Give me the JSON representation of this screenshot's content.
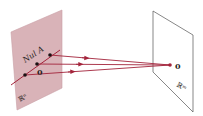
{
  "diagram": {
    "type": "linear-transformation-kernel",
    "domain_space": {
      "label": "ℝⁿ",
      "color": "#d9b3b8"
    },
    "codomain_space": {
      "label": "ℝᵐ",
      "color": "#ffffff"
    },
    "null_space_label": "Nul A",
    "domain_zero_label": "0",
    "codomain_zero_label": "0",
    "arrow_color": "#a3243b",
    "arrows": [
      {
        "from": "point-on-Nul-A-1",
        "to": "codomain-zero"
      },
      {
        "from": "domain-zero",
        "to": "codomain-zero"
      },
      {
        "from": "point-on-Nul-A-2",
        "to": "codomain-zero"
      }
    ]
  }
}
